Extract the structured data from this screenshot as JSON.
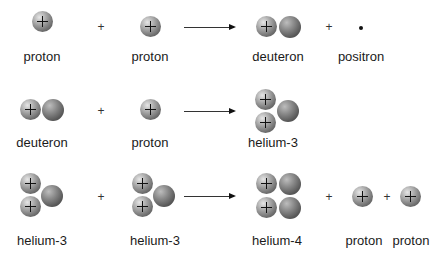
{
  "reactions": [
    {
      "step": 1,
      "reactants": [
        "proton",
        "proton"
      ],
      "products": [
        "deuteron",
        "positron"
      ],
      "labels": {
        "r1": "proton",
        "r2": "proton",
        "p1": "deuteron",
        "p2": "positron"
      }
    },
    {
      "step": 2,
      "reactants": [
        "deuteron",
        "proton"
      ],
      "products": [
        "helium-3"
      ],
      "labels": {
        "r1": "deuteron",
        "r2": "proton",
        "p1": "helium-3"
      }
    },
    {
      "step": 3,
      "reactants": [
        "helium-3",
        "helium-3"
      ],
      "products": [
        "helium-4",
        "proton",
        "proton"
      ],
      "labels": {
        "r1": "helium-3",
        "r2": "helium-3",
        "p1": "helium-4",
        "p2": "proton",
        "p3": "proton"
      }
    }
  ],
  "symbols": {
    "plus": "+",
    "proton_charge": "+"
  },
  "legend": {
    "proton": "light grey sphere with + sign",
    "neutron": "dark grey sphere",
    "positron": "small black dot"
  }
}
